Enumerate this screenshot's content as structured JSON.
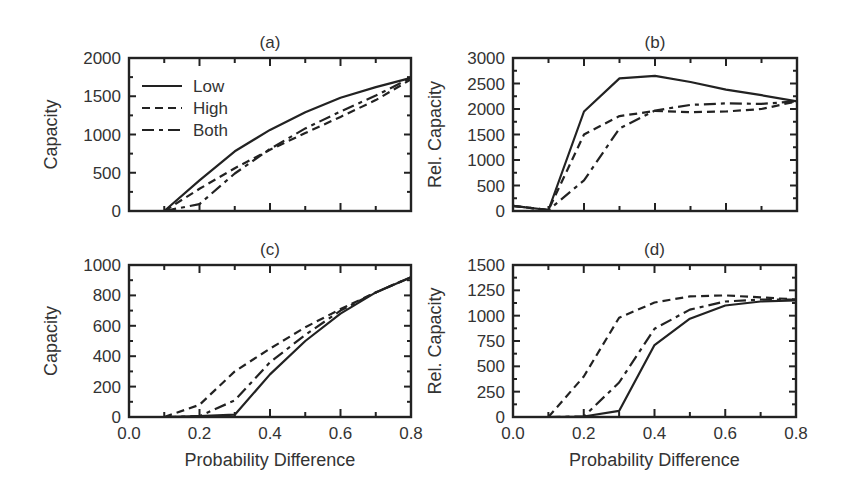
{
  "figure": {
    "xlabel": "Probability Difference",
    "legend": [
      {
        "label": "Low",
        "style": "solid"
      },
      {
        "label": "High",
        "style": "dashed"
      },
      {
        "label": "Both",
        "style": "dashdot"
      }
    ],
    "line_color": "#222222"
  },
  "chart_data": [
    {
      "type": "line",
      "title": "(a)",
      "xlabel": "",
      "ylabel": "Capacity",
      "xlim": [
        0.0,
        0.8
      ],
      "ylim": [
        0,
        2000
      ],
      "xticks": [
        0.0,
        0.2,
        0.4,
        0.6,
        0.8
      ],
      "yticks": [
        0,
        500,
        1000,
        1500,
        2000
      ],
      "yticklabels": [
        "0",
        "500",
        "1000",
        "1500",
        "2000"
      ],
      "legend_position": "upper left",
      "x": [
        0.1,
        0.2,
        0.3,
        0.4,
        0.5,
        0.6,
        0.7,
        0.8
      ],
      "series": [
        {
          "name": "Low",
          "style": "solid",
          "values": [
            0,
            400,
            780,
            1060,
            1290,
            1480,
            1620,
            1740
          ]
        },
        {
          "name": "High",
          "style": "dashed",
          "values": [
            0,
            290,
            560,
            800,
            1020,
            1230,
            1450,
            1720
          ]
        },
        {
          "name": "Both",
          "style": "dashdot",
          "values": [
            0,
            90,
            490,
            810,
            1080,
            1300,
            1510,
            1740
          ]
        }
      ]
    },
    {
      "type": "line",
      "title": "(b)",
      "xlabel": "",
      "ylabel": "Rel. Capacity",
      "xlim": [
        0.0,
        0.8
      ],
      "ylim": [
        0,
        3000
      ],
      "xticks": [
        0.0,
        0.2,
        0.4,
        0.6,
        0.8
      ],
      "yticks": [
        0,
        500,
        1000,
        1500,
        2000,
        2500,
        3000
      ],
      "yticklabels": [
        "0",
        "500",
        "1000",
        "1500",
        "2000",
        "2500",
        "3000"
      ],
      "x": [
        0.0,
        0.1,
        0.2,
        0.3,
        0.4,
        0.5,
        0.6,
        0.7,
        0.8
      ],
      "series": [
        {
          "name": "Low",
          "style": "solid",
          "values": [
            100,
            20,
            1950,
            2600,
            2650,
            2530,
            2380,
            2270,
            2150
          ]
        },
        {
          "name": "High",
          "style": "dashed",
          "values": [
            100,
            20,
            1500,
            1860,
            1960,
            1940,
            1950,
            2000,
            2150
          ]
        },
        {
          "name": "Both",
          "style": "dashdot",
          "values": [
            100,
            20,
            600,
            1620,
            1970,
            2080,
            2110,
            2100,
            2150
          ]
        }
      ]
    },
    {
      "type": "line",
      "title": "(c)",
      "xlabel": "Probability Difference",
      "ylabel": "Capacity",
      "xlim": [
        0.0,
        0.8
      ],
      "ylim": [
        0,
        1000
      ],
      "xticks": [
        0.0,
        0.2,
        0.4,
        0.6,
        0.8
      ],
      "xticklabels": [
        "0.0",
        "0.2",
        "0.4",
        "0.6",
        "0.8"
      ],
      "yticks": [
        0,
        200,
        400,
        600,
        800,
        1000
      ],
      "yticklabels": [
        "0",
        "200",
        "400",
        "600",
        "800",
        "1000"
      ],
      "x": [
        0.1,
        0.2,
        0.3,
        0.4,
        0.5,
        0.6,
        0.7,
        0.8
      ],
      "series": [
        {
          "name": "Low",
          "style": "solid",
          "values": [
            0,
            5,
            15,
            280,
            500,
            680,
            820,
            920
          ]
        },
        {
          "name": "High",
          "style": "dashed",
          "values": [
            0,
            80,
            300,
            450,
            590,
            710,
            820,
            920
          ]
        },
        {
          "name": "Both",
          "style": "dashdot",
          "values": [
            0,
            5,
            110,
            360,
            540,
            700,
            820,
            920
          ]
        }
      ]
    },
    {
      "type": "line",
      "title": "(d)",
      "xlabel": "Probability Difference",
      "ylabel": "Rel. Capacity",
      "xlim": [
        0.0,
        0.8
      ],
      "ylim": [
        0,
        1500
      ],
      "xticks": [
        0.0,
        0.2,
        0.4,
        0.6,
        0.8
      ],
      "xticklabels": [
        "0.0",
        "0.2",
        "0.4",
        "0.6",
        "0.8"
      ],
      "yticks": [
        0,
        250,
        500,
        750,
        1000,
        1250,
        1500
      ],
      "yticklabels": [
        "0",
        "250",
        "500",
        "750",
        "1000",
        "1250",
        "1500"
      ],
      "x": [
        0.1,
        0.2,
        0.3,
        0.4,
        0.5,
        0.6,
        0.7,
        0.8
      ],
      "series": [
        {
          "name": "Low",
          "style": "solid",
          "values": [
            0,
            5,
            60,
            710,
            970,
            1100,
            1140,
            1150
          ]
        },
        {
          "name": "High",
          "style": "dashed",
          "values": [
            0,
            400,
            980,
            1130,
            1190,
            1200,
            1180,
            1160
          ]
        },
        {
          "name": "Both",
          "style": "dashdot",
          "values": [
            0,
            5,
            340,
            870,
            1060,
            1140,
            1160,
            1160
          ]
        }
      ]
    }
  ],
  "layout": {
    "panels": [
      {
        "left": 129,
        "right": 411,
        "top": 58,
        "bottom": 211,
        "show_xticklabels": false,
        "show_xlabel": false,
        "show_legend": true
      },
      {
        "left": 513,
        "right": 797,
        "top": 58,
        "bottom": 211,
        "show_xticklabels": false,
        "show_xlabel": false,
        "show_legend": false
      },
      {
        "left": 129,
        "right": 411,
        "top": 265,
        "bottom": 417,
        "show_xticklabels": true,
        "show_xlabel": true,
        "show_legend": false
      },
      {
        "left": 513,
        "right": 796,
        "top": 265,
        "bottom": 417,
        "show_xticklabels": true,
        "show_xlabel": true,
        "show_legend": false
      }
    ]
  }
}
